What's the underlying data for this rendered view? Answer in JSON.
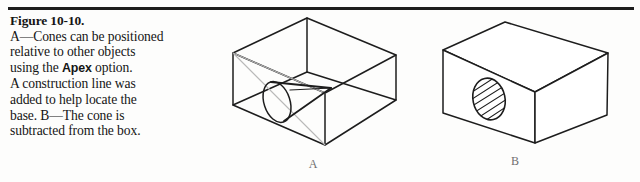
{
  "figure": {
    "heading": "Figure 10-10.",
    "caption_lines": [
      "A—Cones can be positioned",
      "relative to other objects",
      "using the ",
      "A construction line was",
      "added to help locate the",
      "base. B—The cone is",
      "subtracted from the box."
    ],
    "bold_term": "Apex",
    "line3_suffix": " option.",
    "full_caption": "A—Cones can be positioned relative to other objects using the Apex option. A construction line was added to help locate the base. B—The cone is subtracted from the box.",
    "rule_color": "#1d1d1d",
    "ink_color": "#1d1d1d",
    "construction_line_color": "#b9b9b9",
    "label_color": "#6f6f6f"
  },
  "illustrations": [
    {
      "label": "A",
      "name": "wireframe-box-with-cone",
      "description": "Transparent wireframe rectangular box drawn in isometric view containing a cone whose apex touches the far interior corner and whose elliptical base sits toward the left front face. A light construction line runs diagonally from the upper back corner to the lower front corner."
    },
    {
      "label": "B",
      "name": "solid-box-with-conical-hole",
      "description": "Solid shaded-edge rectangular box in isometric view with a hatched elliptical opening on the left front face where the cone has been subtracted."
    }
  ]
}
